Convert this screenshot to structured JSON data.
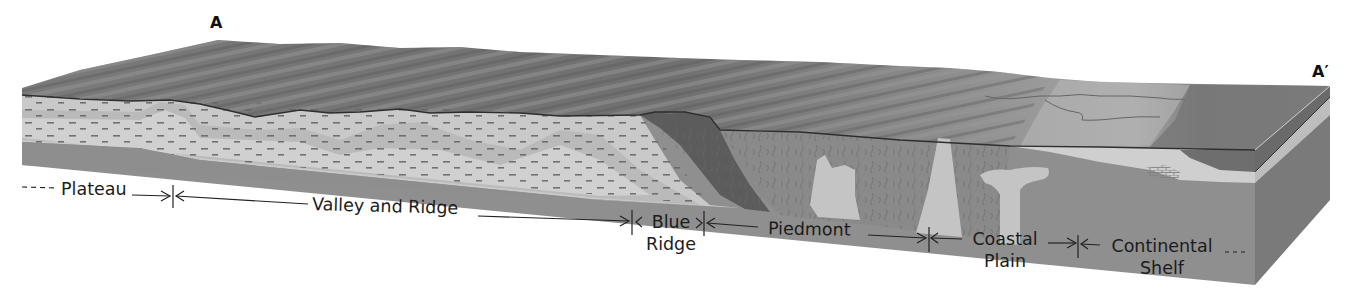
{
  "figure": {
    "type": "block-diagram",
    "section_endpoints": {
      "start": "A",
      "end": "A′"
    }
  },
  "provinces": [
    {
      "id": "plateau",
      "label": "Plateau",
      "lines": [
        "Plateau"
      ],
      "extends_left": true
    },
    {
      "id": "valley-and-ridge",
      "label": "Valley and Ridge",
      "lines": [
        "Valley and Ridge"
      ]
    },
    {
      "id": "blue-ridge",
      "label": "Blue Ridge",
      "lines": [
        "Blue",
        "Ridge"
      ]
    },
    {
      "id": "piedmont",
      "label": "Piedmont",
      "lines": [
        "Piedmont"
      ]
    },
    {
      "id": "coastal-plain",
      "label": "Coastal Plain",
      "lines": [
        "Coastal",
        "Plain"
      ]
    },
    {
      "id": "continental-shelf",
      "label": "Continental Shelf",
      "lines": [
        "Continental",
        "Shelf"
      ],
      "extends_right": true
    }
  ],
  "colors": {
    "surface_dark": "#6e6e6e",
    "surface_mid": "#8a8a8a",
    "surface_light": "#a9a9a9",
    "sediment_light": "#d3d3d3",
    "sediment_mid": "#b8b8b8",
    "basement": "#8c8c8c",
    "blue_ridge_rock": "#5c5c5c",
    "piedmont_rock": "#8f8f8f",
    "intrusion": "#c4c4c4",
    "ocean_surface": "#7d7d7d",
    "text": "#1c1c1c"
  }
}
